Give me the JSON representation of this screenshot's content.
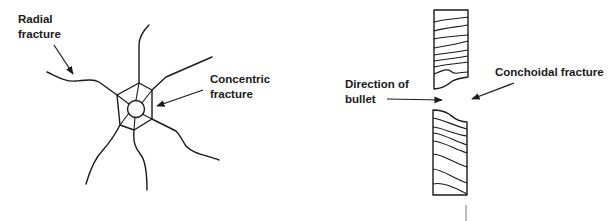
{
  "diagram": {
    "left_panel": {
      "title": "Glass fracture pattern",
      "labels": {
        "radial": [
          "Radial",
          "fracture"
        ],
        "concentric": [
          "Concentric",
          "fracture"
        ]
      },
      "radial_line_count": 6,
      "concentric_shapes": [
        "hexagon",
        "circle"
      ]
    },
    "right_panel": {
      "title": "Cross-section of bullet hole",
      "labels": {
        "direction": [
          "Direction of",
          "bullet"
        ],
        "conchoidal": "Conchoidal fracture"
      }
    },
    "colors": {
      "ink": "#1a1a1a",
      "background": "#ffffff"
    }
  }
}
